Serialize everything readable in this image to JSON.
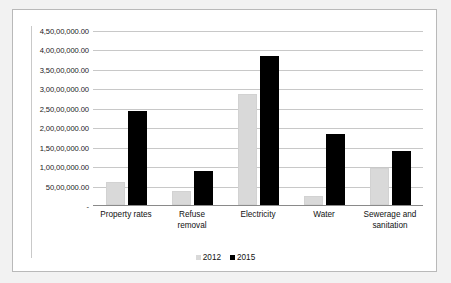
{
  "chart_data": {
    "type": "bar",
    "title": "",
    "xlabel": "",
    "ylabel": "",
    "categories": [
      "Property rates",
      "Refuse removal",
      "Electricity",
      "Water",
      "Sewerage and sanitation"
    ],
    "category_lines": [
      [
        "Property rates"
      ],
      [
        "Refuse",
        "removal"
      ],
      [
        "Electricity"
      ],
      [
        "Water"
      ],
      [
        "Sewerage and",
        "sanitation"
      ]
    ],
    "series": [
      {
        "name": "2012",
        "color": "#d9d9d9",
        "values": [
          6000000,
          3700000,
          28500000,
          2200000,
          9400000
        ]
      },
      {
        "name": "2015",
        "color": "#000000",
        "values": [
          24300000,
          8700000,
          38200000,
          18200000,
          13900000
        ]
      }
    ],
    "ylim": [
      0,
      45000000
    ],
    "ytick_values": [
      0,
      5000000,
      10000000,
      15000000,
      20000000,
      25000000,
      30000000,
      35000000,
      40000000,
      45000000
    ],
    "ytick_labels": [
      "-",
      "50,00,000.00",
      "1,00,00,000.00",
      "1,50,00,000.00",
      "2,00,00,000.00",
      "2,50,00,000.00",
      "3,00,00,000.00",
      "3,50,00,000.00",
      "4,00,00,000.00",
      "4,50,00,000.00"
    ],
    "grid": true,
    "legend_position": "bottom",
    "legend_entries": [
      {
        "label": "2012",
        "marker": "square-light-gray"
      },
      {
        "label": "2015",
        "marker": "square-black"
      }
    ]
  },
  "colors": {
    "background": "#f2f2f2",
    "plot_background": "#ffffff",
    "gridline": "#c8c8c8",
    "axis": "#8a8a8a",
    "border": "#b9b9b9",
    "series_2012": "#d9d9d9",
    "series_2015": "#000000",
    "text": "#111111"
  }
}
